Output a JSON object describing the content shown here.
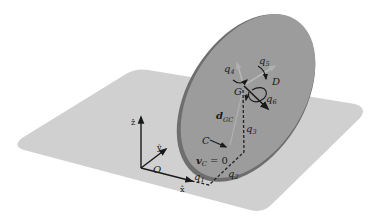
{
  "diagram": {
    "colors": {
      "background": "#ffffff",
      "plane": "#d0d0d0",
      "disk_face": "#9a9a9a",
      "disk_rim": "#6e6e6e",
      "ink": "#1a1a1a",
      "dash": "#222222",
      "light_arrow": "#b8b8b8"
    },
    "labels": {
      "z_axis": "ẑ",
      "y_axis": "ŷ",
      "x_axis": "x̂",
      "origin": "O",
      "q1": "q",
      "q1_sub": "1",
      "q2": "q",
      "q2_sub": "2",
      "q3": "q",
      "q3_sub": "3",
      "q4": "q",
      "q4_sub": "4",
      "q5": "q",
      "q5_sub": "5",
      "q6": "q",
      "q6_sub": "6",
      "center": "G",
      "contact": "C",
      "direction": "D",
      "d_vec": "d",
      "d_vec_sub": "GC",
      "vc_eq": "v",
      "vc_sub": "C",
      "vc_rhs": " = 0"
    }
  }
}
